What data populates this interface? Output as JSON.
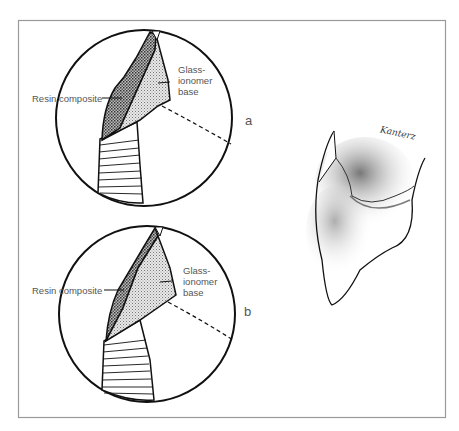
{
  "figure": {
    "panels": [
      {
        "id": "a",
        "tag": "a",
        "label_left": "Resin composite",
        "label_right": [
          "Glass-",
          "ionomer",
          "base"
        ]
      },
      {
        "id": "b",
        "tag": "b",
        "label_left": "Resin composite",
        "label_right": [
          "Glass-",
          "ionomer",
          "base"
        ]
      }
    ],
    "signature": "Kanterz",
    "colors": {
      "line": "#111111",
      "frame": "#9a9a9a",
      "text": "#555555"
    }
  }
}
